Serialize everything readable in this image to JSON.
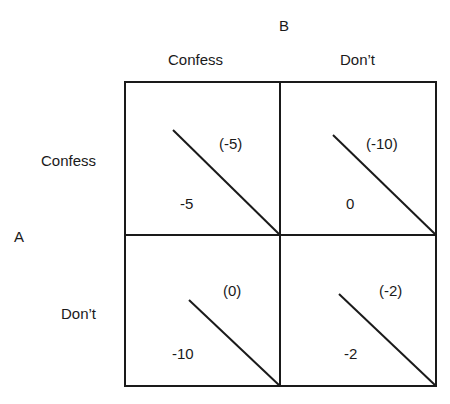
{
  "players": {
    "column_player": "B",
    "row_player": "A"
  },
  "column_strategies": [
    "Confess",
    "Don’t"
  ],
  "row_strategies": [
    "Confess",
    "Don’t"
  ],
  "cells": [
    {
      "row": "Confess",
      "col": "Confess",
      "payoff_A": "-5",
      "payoff_B": "(-5)"
    },
    {
      "row": "Confess",
      "col": "Don’t",
      "payoff_A": "0",
      "payoff_B": "(-10)"
    },
    {
      "row": "Don’t",
      "col": "Confess",
      "payoff_A": "-10",
      "payoff_B": "(0)"
    },
    {
      "row": "Don’t",
      "col": "Don’t",
      "payoff_A": "-2",
      "payoff_B": "(-2)"
    }
  ],
  "colors": {
    "ink": "#1a1a1a",
    "background": "#ffffff"
  }
}
